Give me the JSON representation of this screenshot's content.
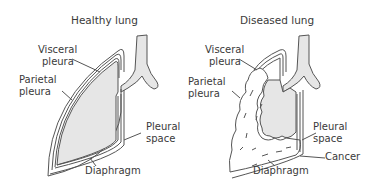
{
  "panels": [
    {
      "title": "Healthy lung",
      "labels": {
        "visceral_1": "Visceral",
        "visceral_2": "pleura",
        "parietal_1": "Parietal",
        "parietal_2": "pleura",
        "pleural_1": "Pleural",
        "pleural_2": "space",
        "diaphragm": "Diaphragm"
      }
    },
    {
      "title": "Diseased lung",
      "labels": {
        "visceral_1": "Visceral",
        "visceral_2": "pleura",
        "parietal_1": "Parietal",
        "parietal_2": "pleura",
        "pleural_1": "Pleural",
        "pleural_2": "space",
        "cancer": "Cancer",
        "diaphragm": "Diaphragm"
      }
    }
  ],
  "colors": {
    "lung_fill": "#e6e6e6",
    "outline": "#555555",
    "tumor_fill": "#ffffff"
  }
}
